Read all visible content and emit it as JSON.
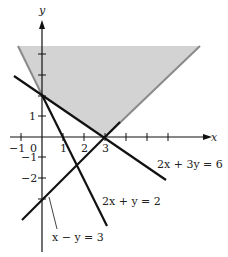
{
  "diagram": {
    "type": "linear-inequalities-graph",
    "axes": {
      "x_label": "x",
      "y_label": "y",
      "x_ticks": [
        "−1",
        "0",
        "1",
        "2",
        "3"
      ],
      "y_ticks": [
        "1",
        "−1",
        "−2"
      ]
    },
    "lines": [
      {
        "equation": "2x + 3y = 6",
        "label": "2x + 3y = 6"
      },
      {
        "equation": "2x + y = 2",
        "label": "2x + y = 2"
      },
      {
        "equation": "x − y = 3",
        "label": "x − y = 3"
      }
    ],
    "shaded_region": {
      "color": "#d3d3d3",
      "edge_color": "#8a8a8a"
    },
    "colors": {
      "line": "#111111",
      "axis": "#111111"
    }
  }
}
